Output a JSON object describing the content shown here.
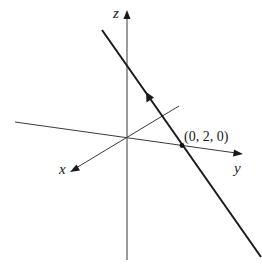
{
  "figure": {
    "type": "3d-line-diagram",
    "axes": {
      "x": {
        "label": "x"
      },
      "y": {
        "label": "y"
      },
      "z": {
        "label": "z"
      }
    },
    "point": {
      "label": "(0, 2, 0)",
      "coords": [
        0,
        2,
        0
      ]
    },
    "colors": {
      "axis": "#3a3a3a",
      "line": "#1a1a1a",
      "background": "#ffffff"
    }
  }
}
